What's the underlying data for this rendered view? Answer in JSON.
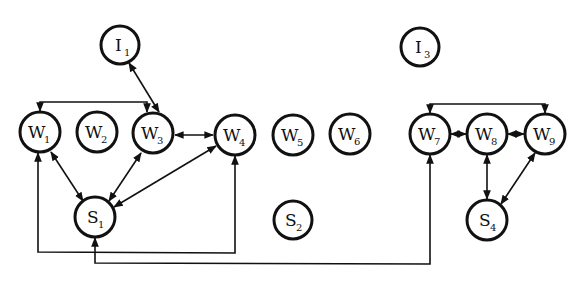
{
  "diagram": {
    "nodes": [
      {
        "id": "I1",
        "letter": "I",
        "sub": "1",
        "cx": 120,
        "cy": 45
      },
      {
        "id": "I3",
        "letter": "I",
        "sub": "3",
        "cx": 420,
        "cy": 47
      },
      {
        "id": "W1",
        "letter": "W",
        "sub": "1",
        "cx": 40,
        "cy": 132
      },
      {
        "id": "W2",
        "letter": "W",
        "sub": "2",
        "cx": 97,
        "cy": 132
      },
      {
        "id": "W3",
        "letter": "W",
        "sub": "3",
        "cx": 153,
        "cy": 133
      },
      {
        "id": "W4",
        "letter": "W",
        "sub": "4",
        "cx": 235,
        "cy": 135
      },
      {
        "id": "W5",
        "letter": "W",
        "sub": "5",
        "cx": 293,
        "cy": 135
      },
      {
        "id": "W6",
        "letter": "W",
        "sub": "6",
        "cx": 350,
        "cy": 134
      },
      {
        "id": "W7",
        "letter": "W",
        "sub": "7",
        "cx": 430,
        "cy": 134
      },
      {
        "id": "W8",
        "letter": "W",
        "sub": "8",
        "cx": 487,
        "cy": 134
      },
      {
        "id": "W9",
        "letter": "W",
        "sub": "9",
        "cx": 545,
        "cy": 134
      },
      {
        "id": "S1",
        "letter": "S",
        "sub": "1",
        "cx": 95,
        "cy": 217
      },
      {
        "id": "S2",
        "letter": "S",
        "sub": "2",
        "cx": 293,
        "cy": 220
      },
      {
        "id": "S4",
        "letter": "S",
        "sub": "4",
        "cx": 487,
        "cy": 220
      }
    ],
    "edges": [
      {
        "from": "I1",
        "to": "W3",
        "type": "bidirectional"
      },
      {
        "from": "W1",
        "to": "W3",
        "type": "bracket-top"
      },
      {
        "from": "W3",
        "to": "W4",
        "type": "bidirectional"
      },
      {
        "from": "W1",
        "to": "S1",
        "type": "bidirectional"
      },
      {
        "from": "W3",
        "to": "S1",
        "type": "bidirectional"
      },
      {
        "from": "W4",
        "to": "S1",
        "type": "bidirectional"
      },
      {
        "from": "W1",
        "to": "W4",
        "type": "bracket-bottom-via-S1"
      },
      {
        "from": "S1",
        "to": "W7",
        "type": "bracket-bottom"
      },
      {
        "from": "W7",
        "to": "W9",
        "type": "bracket-top"
      },
      {
        "from": "W7",
        "to": "W8",
        "type": "bidirectional"
      },
      {
        "from": "W8",
        "to": "W9",
        "type": "bidirectional"
      },
      {
        "from": "W8",
        "to": "S4",
        "type": "bidirectional"
      },
      {
        "from": "W9",
        "to": "S4",
        "type": "bidirectional"
      }
    ]
  }
}
